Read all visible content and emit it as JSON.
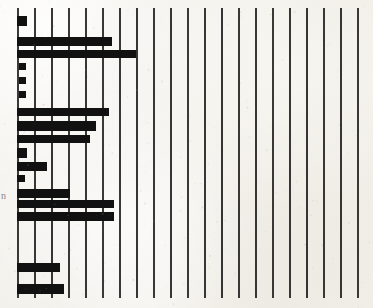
{
  "figure": {
    "name": "scanned-horizontal-bar-chart",
    "width": 373,
    "height": 308,
    "paper_color": "#f3f1ec",
    "ink_color": "#111111",
    "grid_color": "#1a1a1a"
  },
  "axis": {
    "left_margin_text": "n",
    "left_margin_text_visible": true
  },
  "chart_data": {
    "type": "bar",
    "orientation": "horizontal",
    "title": "",
    "subtitle": "",
    "xlabel": "",
    "ylabel": "n",
    "grid": true,
    "grid_axis": "x",
    "grid_count": 22,
    "grid_spacing_px": 17,
    "grid_start_px": 17,
    "legend": [],
    "legend_position": "none",
    "xlim": [
      0,
      21
    ],
    "baseline_px": 17,
    "px_per_unit": 17,
    "xticklabels": [],
    "yticklabels": [],
    "categories": [
      "r1",
      "r2",
      "r3",
      "r4",
      "r5",
      "r6",
      "r7",
      "r8",
      "r9",
      "r10",
      "r11",
      "r12",
      "r13",
      "r14",
      "r15",
      "r16",
      "r17",
      "r18",
      "r19",
      "r20",
      "r21",
      "r22",
      "r23",
      "r24"
    ],
    "values": [
      0.55,
      0.0,
      5.6,
      0.0,
      7.0,
      0.0,
      0.35,
      0.35,
      0.35,
      0.0,
      5.4,
      17.4,
      14.5,
      0.55,
      7.2,
      0.0,
      10.5,
      17.1,
      17.1,
      0.0,
      0.0,
      7.4,
      0.0,
      9.6
    ],
    "bars": [
      {
        "index": 0,
        "y_px": 16,
        "height_px": 10,
        "x_px": 17,
        "width_px": 10,
        "value": 0.55
      },
      {
        "index": 1,
        "y_px": 37,
        "height_px": 9,
        "x_px": 17,
        "width_px": 95,
        "value": 5.6
      },
      {
        "index": 2,
        "y_px": 50,
        "height_px": 8,
        "x_px": 17,
        "width_px": 119,
        "value": 7.0
      },
      {
        "index": 3,
        "y_px": 63,
        "height_px": 7,
        "x_px": 19,
        "width_px": 7,
        "value": 0.35
      },
      {
        "index": 4,
        "y_px": 77,
        "height_px": 7,
        "x_px": 19,
        "width_px": 7,
        "value": 0.35
      },
      {
        "index": 5,
        "y_px": 91,
        "height_px": 7,
        "x_px": 19,
        "width_px": 7,
        "value": 0.35
      },
      {
        "index": 6,
        "y_px": 108,
        "height_px": 8,
        "x_px": 17,
        "width_px": 92,
        "value": 5.4
      },
      {
        "index": 7,
        "y_px": 121,
        "height_px": 10,
        "x_px": 17,
        "width_px": 79,
        "value": 4.6
      },
      {
        "index": 8,
        "y_px": 122,
        "height_px": 9,
        "x_px": 17,
        "width_px": 79,
        "value": 4.6
      },
      {
        "index": 9,
        "y_px": 135,
        "height_px": 8,
        "x_px": 17,
        "width_px": 73,
        "value": 4.2
      },
      {
        "index": 10,
        "y_px": 148,
        "height_px": 10,
        "x_px": 17,
        "width_px": 10,
        "value": 0.55
      },
      {
        "index": 11,
        "y_px": 162,
        "height_px": 9,
        "x_px": 17,
        "width_px": 30,
        "value": 1.7
      },
      {
        "index": 12,
        "y_px": 175,
        "height_px": 7,
        "x_px": 17,
        "width_px": 8,
        "value": 0.45
      },
      {
        "index": 13,
        "y_px": 189,
        "height_px": 9,
        "x_px": 17,
        "width_px": 53,
        "value": 3.1
      },
      {
        "index": 14,
        "y_px": 200,
        "height_px": 8,
        "x_px": 17,
        "width_px": 97,
        "value": 5.7
      },
      {
        "index": 15,
        "y_px": 212,
        "height_px": 9,
        "x_px": 17,
        "width_px": 97,
        "value": 5.7
      },
      {
        "index": 16,
        "y_px": 263,
        "height_px": 9,
        "x_px": 17,
        "width_px": 43,
        "value": 2.5
      },
      {
        "index": 17,
        "y_px": 284,
        "height_px": 10,
        "x_px": 17,
        "width_px": 47,
        "value": 2.7
      }
    ]
  }
}
